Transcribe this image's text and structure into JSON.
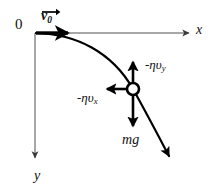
{
  "figure": {
    "background_color": "#ffffff",
    "width": 213,
    "height": 193
  },
  "axes": {
    "origin_label": "0",
    "x_axis_label": "x",
    "y_axis_label": "y",
    "axis_color": "#8a8a8a",
    "origin_point": [
      35,
      33
    ],
    "x_axis_end": [
      192,
      33
    ],
    "y_axis_end": [
      35,
      162
    ],
    "x_direction": "right",
    "y_direction": "down"
  },
  "vectors": {
    "initial_velocity": {
      "label": "v",
      "subscript": "0",
      "has_arrow_overbar": true,
      "color": "#000000",
      "from": [
        36,
        33
      ],
      "to": [
        72,
        33
      ],
      "direction": "right"
    },
    "drag_y": {
      "label_prefix": "-",
      "label_eta": "η",
      "label_v": "υ",
      "subscript": "y",
      "full_label": "-ηυy",
      "color": "#000000",
      "from": [
        133,
        83
      ],
      "to": [
        133,
        60
      ],
      "direction": "up"
    },
    "drag_x": {
      "label_prefix": "-",
      "label_eta": "η",
      "label_v": "υ",
      "subscript": "x",
      "full_label": "-ηυx",
      "color": "#000000",
      "from": [
        128,
        89
      ],
      "to": [
        104,
        89
      ],
      "direction": "left"
    },
    "weight": {
      "label_m": "m",
      "label_g": "g",
      "full_label": "mg",
      "color": "#000000",
      "from": [
        133,
        95
      ],
      "to": [
        133,
        129
      ],
      "direction": "down"
    }
  },
  "particle": {
    "name": "projectile-ball",
    "center": [
      133,
      89
    ],
    "radius": 6,
    "fill": "#ffffff",
    "stroke": "#000000",
    "stroke_width": 2.6
  },
  "trajectory": {
    "name": "projectile-path",
    "color": "#000000",
    "stroke_width": 2.2,
    "has_end_arrow": true,
    "start": [
      36,
      33
    ],
    "end": [
      172,
      160
    ],
    "description": "Curve launched horizontally from the origin, bending downward under gravity and drag"
  },
  "colors": {
    "ink": "#000000",
    "axis_gray": "#8a8a8a",
    "paper": "#ffffff"
  }
}
